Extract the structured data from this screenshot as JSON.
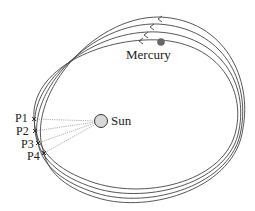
{
  "diagram": {
    "bodies": {
      "sun": {
        "label": "Sun",
        "cx": 101,
        "cy": 121,
        "r": 6.5,
        "fill": "#d9d9d9"
      },
      "mercury": {
        "label": "Mercury",
        "cx": 161,
        "cy": 42,
        "r": 3.8,
        "fill": "#666666"
      }
    },
    "perihelion_points": [
      {
        "label": "P1",
        "x": 34,
        "y": 119
      },
      {
        "label": "P2",
        "x": 35,
        "y": 131
      },
      {
        "label": "P3",
        "x": 38,
        "y": 143
      },
      {
        "label": "P4",
        "x": 44,
        "y": 153
      }
    ],
    "orbit_count": 4,
    "direction": "counter-clockwise (arrows point left at top)"
  }
}
